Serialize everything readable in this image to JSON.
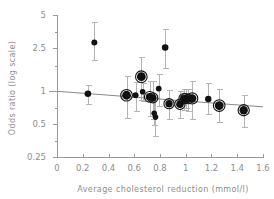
{
  "chart_data": {
    "type": "scatter",
    "title": "",
    "xlabel": "Average cholesterol reduction (mmol/l)",
    "ylabel": "Odds ratio (log scale)",
    "xlim": [
      0,
      1.6
    ],
    "ylim": [
      0.25,
      5
    ],
    "yscale": "log",
    "grid": false,
    "legend": null,
    "xticks": [
      0,
      0.2,
      0.4,
      0.6,
      0.8,
      1,
      1.2,
      1.4,
      1.6
    ],
    "xticklabels": [
      "0",
      "0.2",
      "0.4",
      "0.6",
      "0.8",
      "1",
      "1.2",
      "1.4",
      "1.6"
    ],
    "yticks": [
      0.25,
      0.5,
      1,
      2.5,
      5
    ],
    "yticklabels": [
      "0.25",
      "0.5",
      "1",
      "2.5",
      "5"
    ],
    "yminorticks": [
      0.35,
      0.7,
      1.7,
      3.5
    ],
    "points": [
      {
        "x": 0.24,
        "y": 0.95,
        "ylow": 0.77,
        "yhigh": 1.15,
        "size": 3.3,
        "ring": false
      },
      {
        "x": 0.29,
        "y": 2.8,
        "ylow": 1.95,
        "yhigh": 4.3,
        "size": 3.0,
        "ring": false
      },
      {
        "x": 0.54,
        "y": 0.92,
        "ylow": 0.57,
        "yhigh": 1.38,
        "size": 4.4,
        "ring": true
      },
      {
        "x": 0.61,
        "y": 0.92,
        "ylow": 0.66,
        "yhigh": 1.22,
        "size": 3.0,
        "ring": false
      },
      {
        "x": 0.655,
        "y": 1.36,
        "ylow": 0.84,
        "yhigh": 2.05,
        "size": 4.4,
        "ring": true
      },
      {
        "x": 0.665,
        "y": 0.99,
        "ylow": 0.82,
        "yhigh": 1.2,
        "size": 2.8,
        "ring": false
      },
      {
        "x": 0.72,
        "y": 0.89,
        "ylow": 0.6,
        "yhigh": 1.25,
        "size": 3.9,
        "ring": true
      },
      {
        "x": 0.745,
        "y": 0.87,
        "ylow": 0.56,
        "yhigh": 1.24,
        "size": 3.6,
        "ring": true
      },
      {
        "x": 0.755,
        "y": 0.63,
        "ylow": 0.49,
        "yhigh": 0.88,
        "size": 2.8,
        "ring": false
      },
      {
        "x": 0.765,
        "y": 0.58,
        "ylow": 0.39,
        "yhigh": 0.86,
        "size": 2.8,
        "ring": false
      },
      {
        "x": 0.79,
        "y": 1.06,
        "ylow": 0.74,
        "yhigh": 1.44,
        "size": 2.9,
        "ring": false
      },
      {
        "x": 0.84,
        "y": 2.52,
        "ylow": 1.62,
        "yhigh": 3.7,
        "size": 3.3,
        "ring": false
      },
      {
        "x": 0.87,
        "y": 0.77,
        "ylow": 0.56,
        "yhigh": 1.02,
        "size": 3.7,
        "ring": true
      },
      {
        "x": 0.955,
        "y": 0.76,
        "ylow": 0.57,
        "yhigh": 1.0,
        "size": 3.8,
        "ring": true
      },
      {
        "x": 0.985,
        "y": 0.86,
        "ylow": 0.68,
        "yhigh": 1.06,
        "size": 3.5,
        "ring": true
      },
      {
        "x": 1.0,
        "y": 0.86,
        "ylow": 0.7,
        "yhigh": 1.04,
        "size": 3.6,
        "ring": true
      },
      {
        "x": 1.02,
        "y": 0.85,
        "ylow": 0.66,
        "yhigh": 1.06,
        "size": 3.4,
        "ring": true
      },
      {
        "x": 1.05,
        "y": 0.86,
        "ylow": 0.56,
        "yhigh": 1.25,
        "size": 4.2,
        "ring": true
      },
      {
        "x": 1.175,
        "y": 0.85,
        "ylow": 0.62,
        "yhigh": 1.18,
        "size": 3.2,
        "ring": false
      },
      {
        "x": 1.26,
        "y": 0.74,
        "ylow": 0.52,
        "yhigh": 1.06,
        "size": 4.4,
        "ring": true
      },
      {
        "x": 1.45,
        "y": 0.67,
        "ylow": 0.47,
        "yhigh": 0.92,
        "size": 4.2,
        "ring": true
      }
    ],
    "regression_line": {
      "x_start": 0,
      "y_start": 1.0,
      "x_end": 1.6,
      "y_end": 0.72
    },
    "colors": {
      "marker": "#111111",
      "errorbar": "#b4b4b4",
      "axis": "#9a9a9a",
      "text": "#8d8d8d",
      "regression": "#8a8a8a",
      "background": "#ffffff"
    }
  }
}
